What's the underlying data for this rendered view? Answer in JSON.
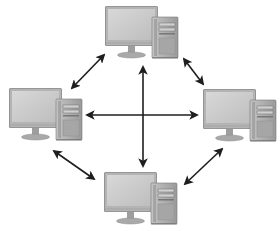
{
  "diagram": {
    "type": "network-topology",
    "colors": {
      "background": "#ffffff",
      "arrow": "#1e1e1e",
      "monitor_bezel": "#8a8a8a",
      "monitor_bezel_light": "#b5b5b5",
      "monitor_screen": "#c9c9c9",
      "monitor_screen_highlight": "#dcdcdc",
      "stand": "#9a9a9a",
      "base": "#a8a8a8",
      "tower_body": "#9c9c9c",
      "tower_face": "#b8b8b8",
      "tower_side": "#7d7d7d",
      "drive_bay": "#6e6e6e"
    },
    "nodes": [
      {
        "id": "top",
        "label": "Computer (top)",
        "x": 105,
        "y": 6
      },
      {
        "id": "left",
        "label": "Computer (left)",
        "x": 9,
        "y": 89
      },
      {
        "id": "right",
        "label": "Computer (right)",
        "x": 203,
        "y": 90
      },
      {
        "id": "bottom",
        "label": "Computer (bottom)",
        "x": 104,
        "y": 172
      }
    ],
    "connections": [
      {
        "from": "top",
        "to": "left",
        "x1": 104,
        "y1": 55,
        "x2": 72,
        "y2": 88,
        "bidirectional": true
      },
      {
        "from": "top",
        "to": "right",
        "x1": 184,
        "y1": 59,
        "x2": 203,
        "y2": 84,
        "bidirectional": true
      },
      {
        "from": "left",
        "to": "bottom",
        "x1": 54,
        "y1": 151,
        "x2": 94,
        "y2": 179,
        "bidirectional": true
      },
      {
        "from": "right",
        "to": "bottom",
        "x1": 222,
        "y1": 149,
        "x2": 185,
        "y2": 184,
        "bidirectional": true
      },
      {
        "from": "top",
        "to": "bottom",
        "x1": 143,
        "y1": 67,
        "x2": 143,
        "y2": 166,
        "bidirectional": true
      },
      {
        "from": "left",
        "to": "right",
        "x1": 87,
        "y1": 115,
        "x2": 197,
        "y2": 115,
        "bidirectional": true
      }
    ]
  }
}
